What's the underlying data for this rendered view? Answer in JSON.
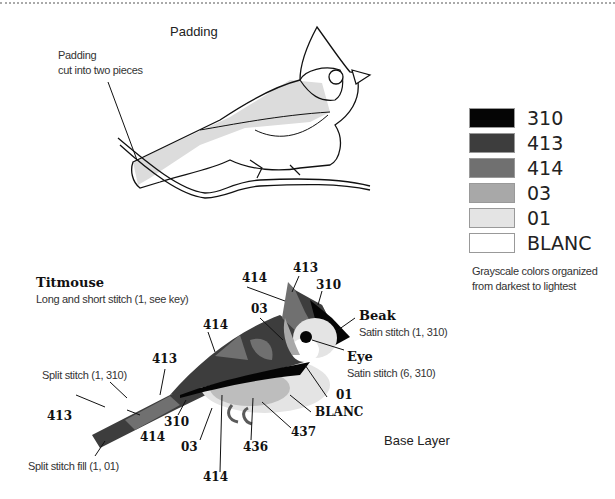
{
  "top": {
    "padding_title": "Padding",
    "padding_note_line1": "Padding",
    "padding_note_line2": "cut into two pieces"
  },
  "legend": {
    "items": [
      {
        "label": "310",
        "color": "#050505"
      },
      {
        "label": "413",
        "color": "#3d3d3d"
      },
      {
        "label": "414",
        "color": "#707070"
      },
      {
        "label": "03",
        "color": "#a8a8a8"
      },
      {
        "label": "01",
        "color": "#e4e4e4"
      },
      {
        "label": "BLANC",
        "color": "#ffffff"
      }
    ],
    "note_line1": "Grayscale colors organized",
    "note_line2": "from darkest to lightest"
  },
  "bottom": {
    "titmouse_title": "Titmouse",
    "titmouse_subtitle": "Long and short stitch (1, see key)",
    "beak_title": "Beak",
    "beak_subtitle": "Satin stitch (1, 310)",
    "eye_title": "Eye",
    "eye_subtitle": "Satin stitch (6, 310)",
    "split_stitch": "Split stitch (1, 310)",
    "split_fill": "Split stitch fill (1, 01)",
    "base_layer": "Base Layer",
    "labels": {
      "crest_414": "414",
      "crest_413": "413",
      "crest_310": "310",
      "cheek_03": "03",
      "wing_414": "414",
      "wing_413": "413",
      "tail_413": "413",
      "tail_414": "414",
      "under_310": "310",
      "belly_03": "03",
      "belly_414": "414",
      "feet_436": "436",
      "belly_437": "437",
      "breast_blanc": "BLANC",
      "breast_01": "01"
    }
  }
}
